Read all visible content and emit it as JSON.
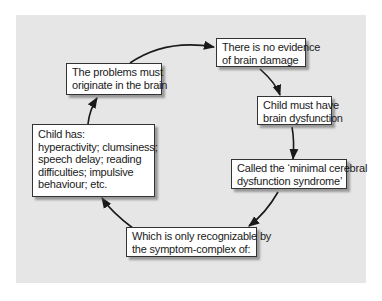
{
  "diagram": {
    "type": "cycle",
    "colors": {
      "panel_background": "#e6e6e6",
      "box_fill": "#ffffff",
      "box_border": "#333333",
      "arrow": "#1a1a1a"
    },
    "nodes": [
      {
        "id": "brain-origin",
        "lines": [
          "The problems must",
          "originate in the brain"
        ]
      },
      {
        "id": "no-evidence",
        "lines": [
          "There is no evidence",
          "of brain damage"
        ]
      },
      {
        "id": "brain-dysfunction",
        "lines": [
          "Child must have",
          "brain dysfunction"
        ]
      },
      {
        "id": "mcd-syndrome",
        "lines": [
          "Called the ‘minimal cerebral",
          "dysfunction syndrome’"
        ]
      },
      {
        "id": "symptom-complex",
        "lines": [
          "Which is only recognizable by",
          "the symptom-complex of:"
        ]
      },
      {
        "id": "child-has",
        "lines": [
          "Child has:",
          "hyperactivity; clumsiness;",
          "speech delay; reading",
          "difficulties; impulsive",
          "behaviour; etc."
        ]
      }
    ],
    "edges": [
      {
        "from": "brain-origin",
        "to": "no-evidence"
      },
      {
        "from": "no-evidence",
        "to": "brain-dysfunction"
      },
      {
        "from": "brain-dysfunction",
        "to": "mcd-syndrome"
      },
      {
        "from": "mcd-syndrome",
        "to": "symptom-complex"
      },
      {
        "from": "symptom-complex",
        "to": "child-has"
      },
      {
        "from": "child-has",
        "to": "brain-origin"
      }
    ]
  }
}
